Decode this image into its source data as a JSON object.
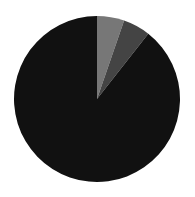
{
  "chart_data": {
    "type": "pie",
    "title": "",
    "start_angle_deg": 0,
    "direction": "clockwise",
    "center": [
      97,
      99
    ],
    "radius": 83,
    "slices": [
      {
        "label": "",
        "value": 5.3,
        "color": "#777777"
      },
      {
        "label": "",
        "value": 5.3,
        "color": "#444444"
      },
      {
        "label": "",
        "value": 89.4,
        "color": "#111111"
      }
    ],
    "legend": null
  }
}
